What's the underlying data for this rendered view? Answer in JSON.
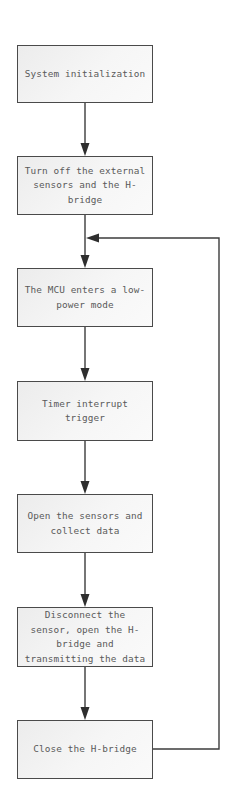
{
  "diagram": {
    "type": "flowchart",
    "colors": {
      "background": "#ffffff",
      "node_border": "#4a4a4a",
      "node_fill": "#f2f2f2",
      "text": "#5a5a5a",
      "edge": "#3c3c3c"
    },
    "nodes": [
      {
        "id": "n1",
        "label": "System initialization"
      },
      {
        "id": "n2",
        "label": "Turn off the external\nsensors and the H-\nbridge"
      },
      {
        "id": "n3",
        "label": "The MCU enters a low-\npower mode"
      },
      {
        "id": "n4",
        "label": "Timer interrupt\ntrigger"
      },
      {
        "id": "n5",
        "label": "Open the sensors and\ncollect data"
      },
      {
        "id": "n6",
        "label": "Disconnect the\nsensor, open the H-\nbridge and\ntransmitting the data"
      },
      {
        "id": "n7",
        "label": "Close the H-bridge"
      }
    ],
    "edges": [
      {
        "from": "n1",
        "to": "n2"
      },
      {
        "from": "n2",
        "to": "n3"
      },
      {
        "from": "n3",
        "to": "n4"
      },
      {
        "from": "n4",
        "to": "n5"
      },
      {
        "from": "n5",
        "to": "n6"
      },
      {
        "from": "n6",
        "to": "n7"
      },
      {
        "from": "n7",
        "to": "n3",
        "type": "loop-back",
        "route": "right"
      }
    ]
  }
}
